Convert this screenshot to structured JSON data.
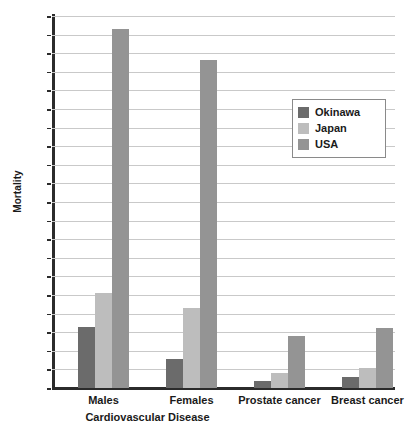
{
  "chart_data": {
    "type": "bar",
    "title": "",
    "xlabel": "",
    "ylabel": "Mortality",
    "ylim": [
      0,
      200
    ],
    "ytick_step": 10,
    "yticks": [
      0,
      10,
      20,
      30,
      40,
      50,
      60,
      70,
      80,
      90,
      100,
      110,
      120,
      130,
      140,
      150,
      160,
      170,
      180,
      190,
      200
    ],
    "grid": true,
    "legend_position": "upper-right",
    "categories": [
      "Males",
      "Females",
      "Prostate cancer",
      "Breast cancer"
    ],
    "group_labels": [
      {
        "label": "Cardiovascular Disease",
        "spans": [
          "Males",
          "Females"
        ]
      }
    ],
    "series": [
      {
        "name": "Okinawa",
        "color": "#6b6b6b",
        "values": [
          33,
          15.5,
          4,
          6
        ]
      },
      {
        "name": "Japan",
        "color": "#bdbdbd",
        "values": [
          51,
          43,
          8,
          11
        ]
      },
      {
        "name": "USA",
        "color": "#949494",
        "values": [
          193,
          176.5,
          28,
          32.5
        ]
      }
    ]
  },
  "axis": {
    "y_title": "Mortality"
  },
  "legend": {
    "entries": [
      {
        "label": "Okinawa"
      },
      {
        "label": "Japan"
      },
      {
        "label": "USA"
      }
    ]
  }
}
